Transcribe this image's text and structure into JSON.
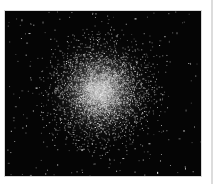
{
  "image": {
    "subject": "globular star cluster",
    "description": "Dense spherical cluster of stars on a black background, bright core fading outward with scattered field stars",
    "colors": {
      "background": "#050505",
      "core": "#f0f0f0",
      "stars": "#cfcfcf",
      "frame_border": "#d8d8d8",
      "page": "#ffffff"
    }
  },
  "caption": {
    "text": ""
  }
}
